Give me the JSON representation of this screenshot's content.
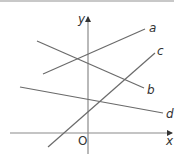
{
  "diagram": {
    "axes": {
      "x_label": "x",
      "y_label": "y",
      "origin_label": "O",
      "color": "#8a8a8a"
    },
    "line_color": "#6a6a6a",
    "lines": [
      {
        "name": "a",
        "label": "a",
        "x1": 43,
        "y1": 74,
        "x2": 145,
        "y2": 29
      },
      {
        "name": "b",
        "label": "b",
        "x1": 37,
        "y1": 41,
        "x2": 144,
        "y2": 88
      },
      {
        "name": "c",
        "label": "c",
        "x1": 48,
        "y1": 147,
        "x2": 155,
        "y2": 53
      },
      {
        "name": "d",
        "label": "d",
        "x1": 20,
        "y1": 87,
        "x2": 163,
        "y2": 113
      }
    ]
  }
}
